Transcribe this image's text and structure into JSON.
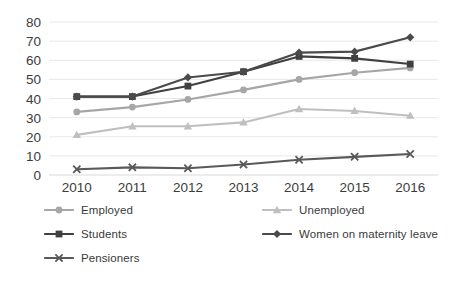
{
  "chart_data": {
    "type": "line",
    "title": "",
    "xlabel": "",
    "ylabel": "",
    "categories": [
      "2010",
      "2011",
      "2012",
      "2013",
      "2014",
      "2015",
      "2016"
    ],
    "x": [
      2010,
      2011,
      2012,
      2013,
      2014,
      2015,
      2016
    ],
    "ylim": [
      0,
      80
    ],
    "ytick_step": 10,
    "yticks": [
      "0",
      "10",
      "20",
      "30",
      "40",
      "50",
      "60",
      "70",
      "80"
    ],
    "grid": "horizontal",
    "legend_position": "bottom",
    "series": [
      {
        "name": "Employed",
        "marker": "circle",
        "color": "#a6a6a6",
        "values": [
          33,
          35.5,
          39.5,
          44.5,
          50,
          53.5,
          56
        ]
      },
      {
        "name": "Unemployed",
        "marker": "triangle",
        "color": "#bfbfbf",
        "values": [
          21,
          25.5,
          25.5,
          27.5,
          34.5,
          33.5,
          31
        ]
      },
      {
        "name": "Students",
        "marker": "square",
        "color": "#404040",
        "values": [
          41,
          41,
          46.5,
          54,
          62,
          61,
          58
        ]
      },
      {
        "name": "Women on maternity leave",
        "marker": "diamond",
        "color": "#4a4a4a",
        "values": [
          41,
          41,
          51,
          54,
          64,
          64.5,
          72
        ]
      },
      {
        "name": "Pensioners",
        "marker": "x",
        "color": "#595959",
        "values": [
          3,
          4,
          3.5,
          5.5,
          8,
          9.5,
          11
        ]
      }
    ]
  },
  "legend": {
    "columns": [
      {
        "items": [
          {
            "label": "Employed",
            "series_index": 0
          },
          {
            "label": "Students",
            "series_index": 2
          },
          {
            "label": "Pensioners",
            "series_index": 4
          }
        ]
      },
      {
        "items": [
          {
            "label": "Unemployed",
            "series_index": 1
          },
          {
            "label": "Women on maternity leave",
            "series_index": 3
          }
        ]
      }
    ]
  },
  "axis": {
    "y_label_color": "#3c3c3c",
    "x_label_color": "#3c3c3c",
    "gridline_color": "#e8e8e8",
    "baseline_color": "#d9d9d9"
  }
}
